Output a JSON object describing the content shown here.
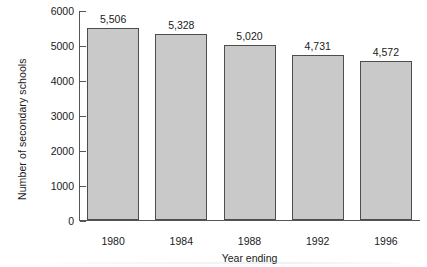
{
  "chart_data": {
    "type": "bar",
    "title": "",
    "categories": [
      "1980",
      "1984",
      "1988",
      "1992",
      "1996"
    ],
    "values": [
      5506,
      5328,
      5020,
      4731,
      4572
    ],
    "value_labels": [
      "5,506",
      "5,328",
      "5,020",
      "4,731",
      "4,572"
    ],
    "xlabel": "Year ending",
    "ylabel": "Number of secondary schools",
    "ylim": [
      0,
      6000
    ],
    "ytick_values": [
      0,
      1000,
      2000,
      3000,
      4000,
      5000,
      6000
    ],
    "ytick_labels": [
      "0",
      "1000",
      "2000",
      "3000",
      "4000",
      "5000",
      "6000"
    ],
    "grid": false,
    "legend": null,
    "bar_fill_color": "#c9c9c9",
    "bar_edge_color": "#4d4d4d",
    "axis_color": "#555555",
    "background_color": "#ffffff"
  }
}
